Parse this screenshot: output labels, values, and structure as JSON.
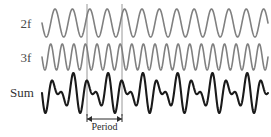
{
  "figure": {
    "background_color": "#ffffff",
    "width": 271,
    "height": 137,
    "labels": {
      "trace_2f": "2f",
      "trace_3f": "3f",
      "trace_sum": "Sum",
      "period": "Period"
    },
    "colors": {
      "harmonic_trace": "#808080",
      "sum_trace": "#1a1a1a",
      "marker_line": "#8c8c8c",
      "label_text": "#4a4a4a",
      "period_text": "#2b2b2b"
    }
  },
  "chart_data": {
    "type": "line",
    "title": "",
    "subtitle": "",
    "xlabel": "",
    "ylabel": "",
    "grid": false,
    "legend_position": "left-inline",
    "annotations": [
      {
        "name": "period-bracket",
        "text": "Period",
        "x_start": 87,
        "x_end": 122,
        "y": 119,
        "span_px": 35,
        "meaning": "One beat period spans 2 cycles of the 2f wave and 3 cycles of the 3f wave"
      },
      {
        "name": "marker-line-left",
        "x": 87,
        "y_top": 4,
        "y_bottom": 116
      },
      {
        "name": "marker-line-right",
        "x": 122,
        "y_top": 4,
        "y_bottom": 116
      }
    ],
    "x": {
      "plot_x_start": 42,
      "plot_x_end": 268,
      "units": "arbitrary time units",
      "domain": [
        0,
        6.5
      ],
      "ticks": [],
      "tick_labels": []
    },
    "series": [
      {
        "name": "2f",
        "label": "2f",
        "color": "#808080",
        "stroke_width": 1.6,
        "waveform": "sine",
        "frequency_cycles_over_plot": 13,
        "amplitude_px": 14,
        "baseline_y_px": 23,
        "phase_deg": 180,
        "label_position": {
          "x": 16,
          "y": 28
        }
      },
      {
        "name": "3f",
        "label": "3f",
        "color": "#808080",
        "stroke_width": 1.6,
        "waveform": "sine",
        "frequency_cycles_over_plot": 19.5,
        "amplitude_px": 13,
        "baseline_y_px": 57,
        "phase_deg": 180,
        "label_position": {
          "x": 16,
          "y": 62
        }
      },
      {
        "name": "Sum",
        "label": "Sum",
        "color": "#1a1a1a",
        "stroke_width": 2.1,
        "waveform": "sum-of-2f-and-3f",
        "frequency_cycles_over_plot": 0,
        "amplitude_px": 20,
        "baseline_y_px": 93,
        "phase_deg": 180,
        "label_position": {
          "x": 8,
          "y": 97
        },
        "components": [
          "2f",
          "3f"
        ]
      }
    ]
  }
}
